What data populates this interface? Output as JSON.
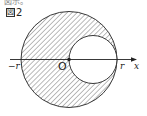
{
  "header": {
    "partial_text": "図示。"
  },
  "figure": {
    "label_box": "図",
    "label_number": "2",
    "axis_labels": {
      "neg_r": "−r",
      "origin": "O",
      "pos_r": "r",
      "x": "x"
    },
    "colors": {
      "stroke": "#222222",
      "hatch": "#555555"
    }
  }
}
